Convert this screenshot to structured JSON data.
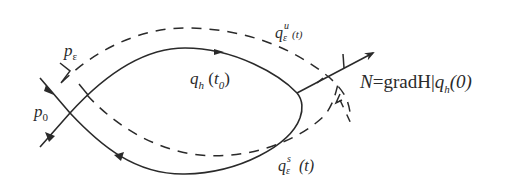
{
  "diagram": {
    "type": "homoclinic orbit perturbation sketch",
    "colors": {
      "stroke": "#2a2a2a",
      "background": "#ffffff"
    },
    "labels": {
      "p_eps": {
        "base": "p",
        "sub": "ε"
      },
      "p_0": {
        "base": "p",
        "sub": "0"
      },
      "q_h_t0": {
        "base": "q",
        "sub": "h",
        "arg_open": " (",
        "arg_base": "t",
        "arg_sub": "0",
        "arg_close": ")"
      },
      "q_u": {
        "base": "q",
        "sup": "u",
        "sub": "ε",
        "arg": "(t)"
      },
      "q_s": {
        "base": "q",
        "sup": "s",
        "sub": "ε",
        "arg": " (t)"
      },
      "normal": {
        "prefix": "N",
        "eq": "=gradH|",
        "q": "q",
        "sub": "h",
        "arg": "(0)"
      }
    },
    "elements": [
      "homoclinic orbit q_h (solid loop with flow arrows)",
      "unstable manifold q_ε^u(t) (dashed)",
      "stable manifold q_ε^s(t) (dashed)",
      "normal vector N at q_h(0)",
      "hyperbolic point p_0 and perturbed point p_ε"
    ]
  }
}
